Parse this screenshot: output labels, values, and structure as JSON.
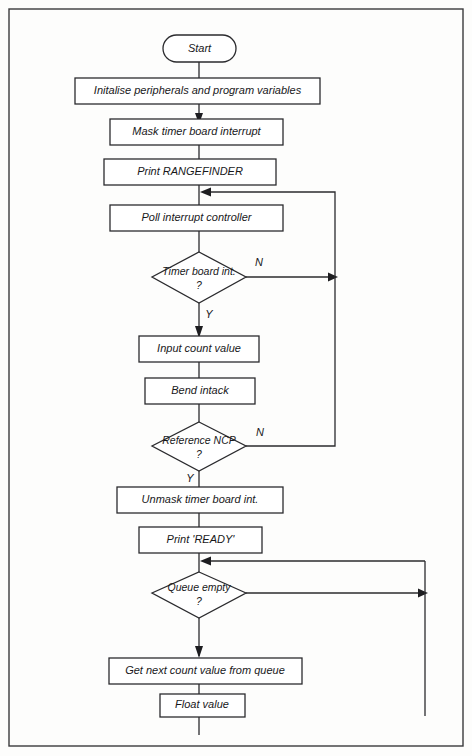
{
  "figure": {
    "border": {
      "color": "#3a3a3d"
    }
  },
  "nodes": {
    "start": {
      "label": "Start",
      "shape": "terminator"
    },
    "init": {
      "label": "Initalise peripherals and program variables",
      "shape": "process"
    },
    "mask": {
      "label": "Mask timer board interrupt",
      "shape": "process"
    },
    "print_rangefinder": {
      "label": "Print RANGEFINDER",
      "shape": "process"
    },
    "poll": {
      "label": "Poll interrupt controller",
      "shape": "process"
    },
    "timer_int": {
      "label": "Timer board int.",
      "label2": "?",
      "shape": "decision"
    },
    "input_count": {
      "label": "Input count value",
      "shape": "process"
    },
    "bend_intack": {
      "label": "Bend intack",
      "shape": "process"
    },
    "reference_ncp": {
      "label": "Reference NCP",
      "label2": "?",
      "shape": "decision"
    },
    "unmask": {
      "label": "Unmask timer board int.",
      "shape": "process"
    },
    "print_ready": {
      "label": "Print 'READY'",
      "shape": "process"
    },
    "queue_empty": {
      "label": "Queue empty",
      "label2": "?",
      "shape": "decision"
    },
    "get_next": {
      "label": "Get next count value from queue",
      "shape": "process"
    },
    "float_value": {
      "label": "Float value",
      "shape": "process"
    }
  },
  "branch_labels": {
    "timer_int_no": "N",
    "timer_int_yes": "Y",
    "reference_ncp_no": "N",
    "reference_ncp_yes": "Y"
  },
  "colors": {
    "stroke": "#2b2b2e",
    "text": "#18181a",
    "background": "#fdfdfc",
    "shape_fill": "#ffffff"
  }
}
